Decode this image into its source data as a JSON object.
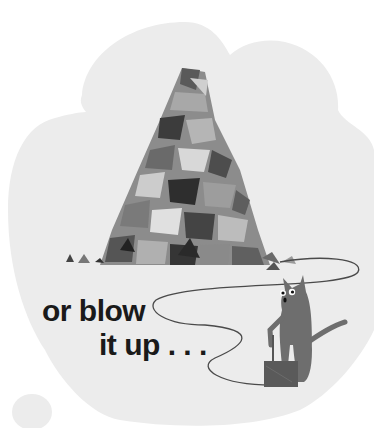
{
  "page": {
    "caption": {
      "line1": "or blow",
      "line2": "it up . . ."
    }
  },
  "colors": {
    "background": "#ffffff",
    "cloud": "#ececec",
    "text": "#1a1a1a",
    "fuse": "#4a4a4a",
    "cat": "#6e6e6e",
    "plunger_box": "#5a5a5a"
  },
  "illustration": {
    "elements": [
      "cloud-background",
      "debris-pile",
      "fuse-wire",
      "cat",
      "detonator-box"
    ]
  }
}
